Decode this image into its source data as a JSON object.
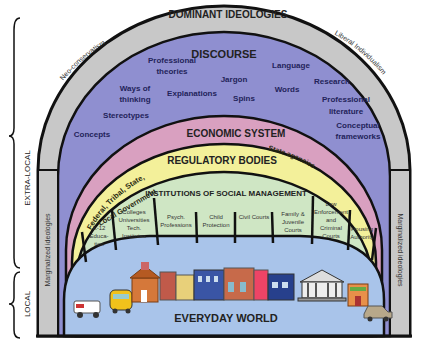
{
  "diagram": {
    "side_labels": {
      "extra_local": "EXTRA-LOCAL",
      "local": "LOCAL"
    },
    "layers": {
      "dominant_ideologies": {
        "title": "DOMINANT IDEOLOGIES",
        "left_label": "Neo-conservatism",
        "right_label": "Liberal Individualism",
        "color": "#c8c8c8"
      },
      "marginalized_ideologies": {
        "left_label": "Marginalized ideologies",
        "right_label": "Marginalized ideologies",
        "color": "#c8c8c8"
      },
      "discourse": {
        "title": "DISCOURSE",
        "color": "#8f8fd0",
        "terms": [
          "Professional theories",
          "Ways of thinking",
          "Explanations",
          "Jargon",
          "Spins",
          "Language",
          "Words",
          "Research",
          "Professional literature",
          "Stereotypes",
          "Concepts",
          "Conceptual frameworks"
        ]
      },
      "economic_system": {
        "title": "ECONOMIC SYSTEM",
        "color": "#d9a0c0"
      },
      "regulatory_bodies": {
        "title": "REGULATORY BODIES",
        "left_label_line1": "Federal, Tribal, State,",
        "left_label_line2": "Local Government",
        "right_label": "State agencies",
        "color": "#f3f09a"
      },
      "institutions": {
        "title": "INSTITUTIONS OF SOCIAL MANAGEMENT",
        "color": "#cfe6c4",
        "items": [
          "K-12 Educa-tion",
          "Colleges Universities Tech. Institutes",
          "Psych. Professions",
          "Child Protection",
          "Civil Courts",
          "Family & Juvenile Courts",
          "Law Enforcement and Criminal Courts",
          "Housing Authority"
        ]
      },
      "everyday_world": {
        "title": "EVERYDAY WORLD",
        "color": "#a9c4ea",
        "icons": [
          "ambulance-icon",
          "school-bus-icon",
          "schoolhouse-icon",
          "storefronts-icon",
          "courthouse-icon",
          "shop-icon",
          "police-car-icon"
        ]
      }
    }
  }
}
